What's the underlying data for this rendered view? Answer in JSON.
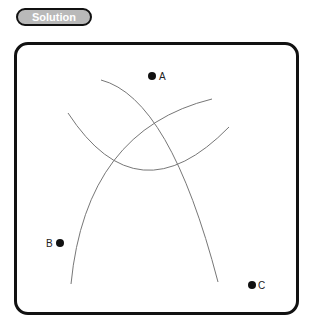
{
  "badge": {
    "label": "Solution"
  },
  "points": [
    {
      "id": "A",
      "label": "A",
      "x": 152,
      "y": 76
    },
    {
      "id": "B",
      "label": "B",
      "x": 60,
      "y": 243
    },
    {
      "id": "C",
      "label": "C",
      "x": 252,
      "y": 285
    }
  ],
  "colors": {
    "frame": "#111111",
    "arc": "#777777",
    "badge_fill": "#b9b9b9"
  }
}
